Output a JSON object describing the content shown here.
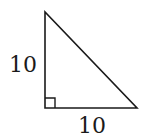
{
  "diagram": {
    "type": "right-triangle",
    "stroke_color": "#1a1a1a",
    "background": "#ffffff",
    "vertices": {
      "top": [
        45,
        12
      ],
      "right_angle": [
        45,
        108
      ],
      "bottom_right": [
        137,
        108
      ]
    },
    "right_angle_marker": true,
    "labels": {
      "vertical_leg": "10",
      "horizontal_leg": "10"
    }
  }
}
